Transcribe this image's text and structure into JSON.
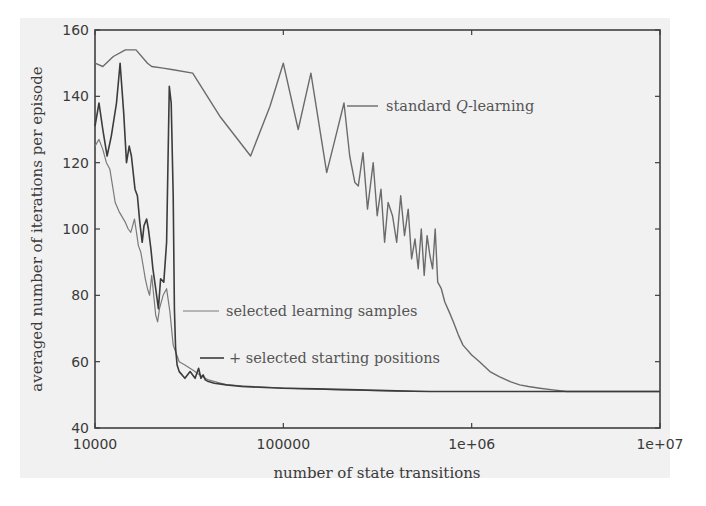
{
  "chart_data": {
    "type": "line",
    "title": "",
    "xlabel": "number of state transitions",
    "ylabel": "averaged number of iterations per episode",
    "xscale": "log",
    "xlim": [
      10000,
      10000000
    ],
    "ylim": [
      40,
      160
    ],
    "x_ticks": [
      "10000",
      "100000",
      "1e+06",
      "1e+07"
    ],
    "y_ticks": [
      "40",
      "60",
      "80",
      "100",
      "120",
      "140",
      "160"
    ],
    "grid": false,
    "legend_position": "inline annotations",
    "series": [
      {
        "name": "standard Q-learning",
        "color": "#6b6b6b",
        "x": [
          10000,
          11000,
          12500,
          14500,
          16500,
          19000,
          20000,
          23000,
          26000,
          33000,
          46000,
          67000,
          85000,
          100000,
          120000,
          140000,
          170000,
          190000,
          210000,
          225000,
          240000,
          250000,
          265000,
          280000,
          300000,
          315000,
          330000,
          345000,
          360000,
          380000,
          400000,
          420000,
          440000,
          460000,
          480000,
          500000,
          520000,
          540000,
          560000,
          580000,
          600000,
          620000,
          640000,
          660000,
          690000,
          720000,
          760000,
          800000,
          850000,
          900000,
          1000000,
          1100000,
          1250000,
          1400000,
          1600000,
          1800000,
          2000000,
          2300000,
          2700000,
          3200000,
          4000000,
          5000000,
          6000000,
          10000000
        ],
        "y": [
          150,
          149,
          152,
          154,
          154,
          150,
          149,
          148.5,
          148,
          147,
          134,
          122,
          137,
          150,
          130,
          147,
          117,
          128,
          138,
          122,
          114,
          113,
          123,
          106,
          120,
          104,
          112,
          96,
          108,
          104,
          96,
          110,
          98,
          106,
          91,
          97,
          88,
          100,
          86,
          98,
          92,
          88,
          100,
          84,
          82,
          78,
          75,
          72,
          68,
          65,
          62,
          60,
          57,
          55.5,
          54,
          53,
          52.5,
          52,
          51.5,
          51,
          51,
          51,
          51,
          51
        ]
      },
      {
        "name": "selected learning samples",
        "color": "#7a7a7a",
        "x": [
          10000,
          10500,
          11000,
          11500,
          12000,
          12800,
          13500,
          14500,
          15000,
          15500,
          16200,
          17000,
          17500,
          18000,
          18500,
          19000,
          19500,
          20000,
          20500,
          21000,
          21500,
          22000,
          23000,
          24000,
          25000,
          26000,
          28000,
          30000,
          33000,
          36000,
          40000,
          50000,
          70000,
          100000,
          200000,
          500000,
          1000000,
          10000000
        ],
        "y": [
          125,
          127,
          124,
          120,
          118,
          108,
          105,
          102,
          100,
          99,
          103,
          95,
          93,
          89,
          85,
          82,
          80,
          86,
          80,
          74,
          72,
          76,
          80,
          82,
          75,
          65,
          60,
          59,
          57.5,
          56,
          54.5,
          53,
          52.5,
          52,
          51.5,
          51,
          51,
          51
        ]
      },
      {
        "name": "+ selected starting positions",
        "color": "#3c3c3c",
        "x": [
          10000,
          10500,
          11000,
          11600,
          12200,
          13000,
          13600,
          14200,
          14700,
          15200,
          15600,
          16300,
          16800,
          17300,
          17800,
          18200,
          18800,
          19200,
          19800,
          20300,
          21000,
          21700,
          22300,
          23200,
          24000,
          24800,
          25400,
          26000,
          26400,
          26800,
          27300,
          28000,
          29000,
          30000,
          32000,
          34000,
          35500,
          36500,
          37500,
          38500,
          40000,
          43000,
          50000,
          60000,
          80000,
          100000,
          150000,
          250000,
          400000,
          600000,
          1000000,
          2000000,
          4000000,
          10000000
        ],
        "y": [
          131,
          138,
          130,
          122,
          128,
          138,
          150,
          135,
          120,
          125,
          122,
          112,
          110,
          102,
          96,
          101,
          103,
          100,
          94,
          88,
          82,
          76,
          85,
          84,
          96,
          143,
          138,
          110,
          76,
          64,
          59,
          57,
          56,
          55,
          57,
          55,
          58,
          55,
          56,
          54.5,
          54,
          53.5,
          53,
          52.5,
          52.2,
          52,
          51.8,
          51.5,
          51.2,
          51,
          51,
          51,
          51,
          51
        ]
      }
    ],
    "annotations": [
      {
        "text": "standard Q-learning",
        "x_px": 385,
        "y_px": 105
      },
      {
        "text": "selected learning samples",
        "x_px": 225,
        "y_px": 312
      },
      {
        "text": "+ selected starting positions",
        "x_px": 230,
        "y_px": 358
      }
    ]
  },
  "labels": {
    "series_0_prefix": "standard ",
    "series_0_italic": "Q",
    "series_0_suffix": "-learning",
    "series_1": "selected learning samples",
    "series_2": "+ selected starting positions"
  }
}
